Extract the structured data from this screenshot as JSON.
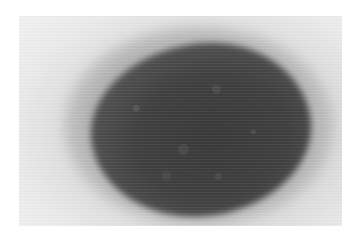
{
  "image": {
    "description": "Grayscale micrograph of a dark oval cell/mass on a light gray background",
    "colors": {
      "background": "#ffffff",
      "photo_background": "#e8e8e8",
      "mass_core": "#3a3a3a",
      "mass_edge": "#777777"
    }
  }
}
